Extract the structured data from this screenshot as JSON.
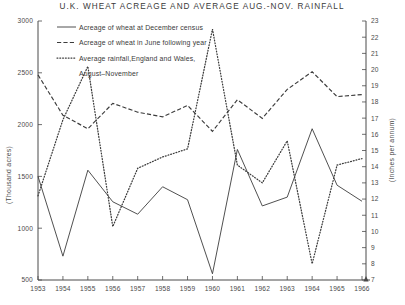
{
  "chart_data": {
    "type": "line",
    "title": "U.K. WHEAT ACREAGE AND AVERAGE AUG.-NOV. RAINFALL",
    "xlabel": "",
    "ylabel": "(Thousand acres)",
    "y2label": "(Inches per annum)",
    "grid": false,
    "legend_position": "top-left",
    "x": [
      1953,
      1954,
      1955,
      1956,
      1957,
      1958,
      1959,
      1960,
      1961,
      1962,
      1963,
      1964,
      1965,
      1966
    ],
    "xtick_labels": [
      "1953",
      "1954",
      "1955",
      "1956",
      "1957",
      "1958",
      "1959",
      "1960",
      "1961",
      "1962",
      "1963",
      "1964",
      "1965",
      "1966"
    ],
    "ylim": [
      500,
      3000
    ],
    "ytick_values": [
      500,
      1000,
      1500,
      2000,
      2500,
      3000
    ],
    "ytick_labels": [
      "500",
      "1000",
      "1500",
      "2000",
      "2500",
      "3000"
    ],
    "y2lim": [
      7,
      23
    ],
    "y2tick_values": [
      7,
      8,
      9,
      10,
      11,
      12,
      13,
      14,
      15,
      16,
      17,
      18,
      19,
      20,
      21,
      22,
      23
    ],
    "y2tick_labels": [
      "7",
      "8",
      "9",
      "10",
      "11",
      "12",
      "13",
      "14",
      "15",
      "16",
      "17",
      "18",
      "19",
      "20",
      "21",
      "22",
      "23"
    ],
    "series": [
      {
        "name": "Acreage of wheat at December census",
        "style": "solid",
        "axis": "left",
        "unit": "thousand acres",
        "values": [
          1500,
          730,
          1560,
          1255,
          1135,
          1400,
          1275,
          560,
          1760,
          1215,
          1300,
          1960,
          1415,
          1260
        ]
      },
      {
        "name": "Acreage of wheat in June following year",
        "style": "dashed",
        "axis": "left",
        "unit": "thousand acres",
        "values": [
          2480,
          2090,
          1960,
          2205,
          2120,
          2075,
          2185,
          1935,
          2240,
          2060,
          2340,
          2510,
          2270,
          2290
        ]
      },
      {
        "name": "Average rainfall, England and Wales, August-November",
        "style": "dotted",
        "axis": "right",
        "unit": "inches per annum",
        "values": [
          12.2,
          16.9,
          20.2,
          10.3,
          13.9,
          14.6,
          15.1,
          22.5,
          14.1,
          13.0,
          15.6,
          8.0,
          14.1,
          14.5
        ]
      }
    ]
  },
  "legend": {
    "items": [
      {
        "label": "Acreage of wheat at December census",
        "style": "solid"
      },
      {
        "label": "Acreage of wheat in June following year",
        "style": "dashed"
      },
      {
        "label": "Average rainfall,England and Wales,",
        "style": "dotted"
      },
      {
        "label": "August–November",
        "style": "none"
      }
    ]
  }
}
